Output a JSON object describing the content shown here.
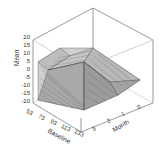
{
  "chart_data": {
    "type": "surface-3d",
    "title": "",
    "xlabel": "Baseline",
    "ylabel": "Month",
    "zlabel": "Mean",
    "x_ticks": [
      "53",
      "73",
      "93",
      "113",
      "133"
    ],
    "y_ticks": [
      "0",
      "1",
      "2",
      "3",
      "4"
    ],
    "z_ticks": [
      "20",
      "15",
      "10",
      "5",
      "0",
      "-5",
      "-10",
      "-15",
      "-20"
    ],
    "zlim": [
      -20,
      20
    ],
    "xlim": [
      53,
      133
    ],
    "ylim": [
      0,
      4
    ],
    "grid": false,
    "legend": null,
    "surface_description": "Wireframe mesh surface; mean increases with month and decreases with baseline; high near low baseline / later months (~15-20), low near high baseline (~-15)",
    "x": [
      53,
      73,
      93,
      113,
      133
    ],
    "y": [
      0,
      1,
      2,
      3,
      4
    ],
    "z": [
      [
        0,
        8,
        14,
        17,
        18
      ],
      [
        0,
        5,
        9,
        11,
        12
      ],
      [
        0,
        1,
        3,
        4,
        5
      ],
      [
        0,
        -3,
        -5,
        -6,
        -7
      ],
      [
        0,
        -6,
        -10,
        -13,
        -15
      ]
    ]
  },
  "axis": {
    "z_label": "Mean",
    "x_label": "Baseline",
    "y_label": "Month",
    "z_ticks": [
      {
        "label": "20",
        "top": 38
      },
      {
        "label": "15",
        "top": 46
      },
      {
        "label": "10",
        "top": 54
      },
      {
        "label": "5",
        "top": 62
      },
      {
        "label": "0",
        "top": 70
      },
      {
        "label": "-5",
        "top": 78
      },
      {
        "label": "-10",
        "top": 86
      },
      {
        "label": "-15",
        "top": 94
      },
      {
        "label": "-20",
        "top": 102
      }
    ],
    "x_ticks": [
      {
        "label": "53",
        "left": 28,
        "top": 108
      },
      {
        "label": "73",
        "left": 40,
        "top": 113
      },
      {
        "label": "93",
        "left": 52,
        "top": 118
      },
      {
        "label": "113",
        "left": 63,
        "top": 123
      },
      {
        "label": "133",
        "left": 76,
        "top": 128
      }
    ],
    "y_ticks": [
      {
        "label": "3",
        "left": 92,
        "top": 126
      },
      {
        "label": "2",
        "left": 107,
        "top": 118
      },
      {
        "label": "1",
        "left": 121,
        "top": 111
      },
      {
        "label": "0",
        "left": 137,
        "top": 104
      }
    ]
  }
}
